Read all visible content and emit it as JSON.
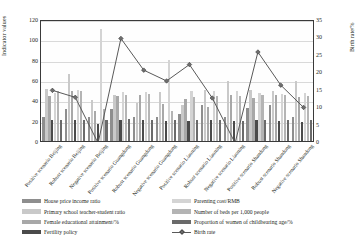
{
  "chart_data": {
    "type": "bar",
    "title": "",
    "xlabel": "",
    "ylabel": "Indicator values",
    "y2label": "Birth rate/%",
    "ylim": [
      0,
      120
    ],
    "y2lim": [
      0,
      35
    ],
    "yticks": [
      "0",
      "20",
      "40",
      "60",
      "80",
      "100",
      "120"
    ],
    "y2ticks": [
      "0",
      "5",
      "10",
      "15",
      "20",
      "25",
      "30",
      "35"
    ],
    "grid": true,
    "legend_position": "bottom",
    "categories": [
      "Positive scenario Beijing",
      "Robust scenario Beijing",
      "Negative scenario Beijing",
      "Positive scenario Guangdong",
      "Robust scenario Guangdong",
      "Negative scenario Guangdong",
      "Positive scenario Liaoning",
      "Robust scenario Liaoning",
      "Negative scenario Liaoning",
      "Positive scenario Shandong",
      "Robust scenario Shandong",
      "Negative scenario Shandong"
    ],
    "series": [
      {
        "name": "House price income ratio",
        "color": "#8e8e8e",
        "values": [
          24,
          31,
          24,
          31,
          24,
          24,
          27,
          35,
          24,
          32,
          35,
          24
        ]
      },
      {
        "name": "Primary school teacher-student ratio",
        "color": "#c9c9c9",
        "values": [
          51,
          66,
          40,
          45,
          37,
          48,
          35,
          50,
          59,
          50,
          49,
          59
        ]
      },
      {
        "name": "Female educational attainment/%",
        "color": "#a8a8a8",
        "values": [
          44,
          49,
          30,
          44,
          45,
          36,
          41,
          33,
          45,
          42,
          45,
          43
        ]
      },
      {
        "name": "Fertility policy",
        "color": "#4a4a4a",
        "values": [
          21,
          21,
          17,
          21,
          21,
          20,
          20,
          21,
          20,
          21,
          20,
          19
        ]
      },
      {
        "name": "Parenting cost/RMB",
        "color": "#d4d4d4",
        "values": [
          47,
          50,
          110,
          48,
          48,
          80,
          49,
          49,
          49,
          47,
          46,
          47
        ]
      },
      {
        "name": "Number of beds per 1,000 people",
        "color": "#b4b4b4",
        "values": [
          49,
          49,
          31,
          45,
          46,
          30,
          43,
          44,
          44,
          45,
          45,
          44
        ]
      },
      {
        "name": "Proportion of women of childbearing age/%",
        "color": "#6a6a6a",
        "values": [
          21,
          21,
          21,
          22,
          21,
          21,
          21,
          21,
          20,
          21,
          21,
          21
        ]
      }
    ],
    "line_series": {
      "name": "Birth rate",
      "color": "#595959",
      "marker": "diamond",
      "axis": "secondary",
      "values": [
        15.1,
        13.1,
        0.0,
        30.0,
        20.9,
        17.8,
        22.5,
        12.9,
        0.0,
        26.1,
        16.6,
        10.2
      ]
    }
  },
  "legend": {
    "left_column": [
      "House price income ratio",
      "Primary school teacher-student ratio",
      "Female educational attainment/%",
      "Fertility policy"
    ],
    "right_column": [
      "Parenting cost/RMB",
      "Number of beds per 1,000 people",
      "Proportion of women of childbearing age/%",
      "Birth rate"
    ]
  }
}
